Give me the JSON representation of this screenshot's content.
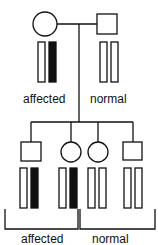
{
  "labels": {
    "parent_affected": "affected",
    "parent_normal": "normal",
    "children_affected": "affected",
    "children_normal": "normal"
  },
  "parents": [
    {
      "sex": "female",
      "status": "affected",
      "chromosomes": [
        "white",
        "black"
      ]
    },
    {
      "sex": "male",
      "status": "normal",
      "chromosomes": [
        "white",
        "white"
      ]
    }
  ],
  "children": [
    {
      "sex": "male",
      "status": "affected",
      "chromosomes": [
        "white",
        "black"
      ]
    },
    {
      "sex": "female",
      "status": "affected",
      "chromosomes": [
        "white",
        "black"
      ]
    },
    {
      "sex": "female",
      "status": "normal",
      "chromosomes": [
        "white",
        "white"
      ]
    },
    {
      "sex": "male",
      "status": "normal",
      "chromosomes": [
        "white",
        "white"
      ]
    }
  ],
  "colors": {
    "line": "#111111",
    "filled": "#111111",
    "empty": "#ffffff"
  }
}
